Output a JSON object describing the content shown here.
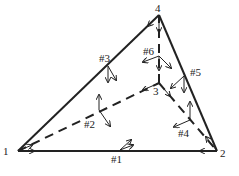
{
  "diagram": {
    "type": "tetrahedron with local coordinate frames",
    "vertices": [
      {
        "id": "1",
        "label": "1",
        "x": 18,
        "y": 151,
        "lx": 3,
        "ly": 146
      },
      {
        "id": "2",
        "label": "2",
        "x": 217,
        "y": 151,
        "lx": 220,
        "ly": 148
      },
      {
        "id": "3",
        "label": "3",
        "x": 159,
        "y": 83,
        "lx": 153,
        "ly": 86
      },
      {
        "id": "4",
        "label": "4",
        "x": 159,
        "y": 15,
        "lx": 155,
        "ly": 3
      }
    ],
    "edges": [
      {
        "id": "#1",
        "label": "#1",
        "from": "1",
        "to": "2",
        "style": "solid",
        "lx": 111,
        "ly": 154
      },
      {
        "id": "#2",
        "label": "#2",
        "from": "1",
        "to": "3",
        "style": "dashed",
        "lx": 84,
        "ly": 119
      },
      {
        "id": "#3",
        "label": "#3",
        "from": "1",
        "to": "4",
        "style": "solid",
        "lx": 99,
        "ly": 53
      },
      {
        "id": "#4",
        "label": "#4",
        "from": "3",
        "to": "2",
        "style": "dashed",
        "lx": 178,
        "ly": 128
      },
      {
        "id": "#5",
        "label": "#5",
        "from": "4",
        "to": "2",
        "style": "solid",
        "lx": 190,
        "ly": 67
      },
      {
        "id": "#6",
        "label": "#6",
        "from": "3",
        "to": "4",
        "style": "dashed",
        "lx": 143,
        "ly": 46
      }
    ]
  }
}
